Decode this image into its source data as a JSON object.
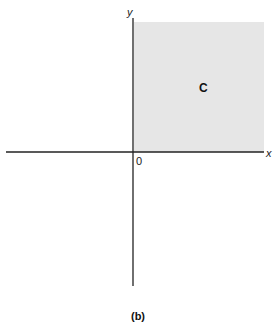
{
  "diagram": {
    "x_axis_label": "x",
    "y_axis_label": "y",
    "origin_label": "0",
    "region_label": "C",
    "region_fill": "#e6e6e6",
    "axis_color": "#222222",
    "caption": "(b)"
  }
}
